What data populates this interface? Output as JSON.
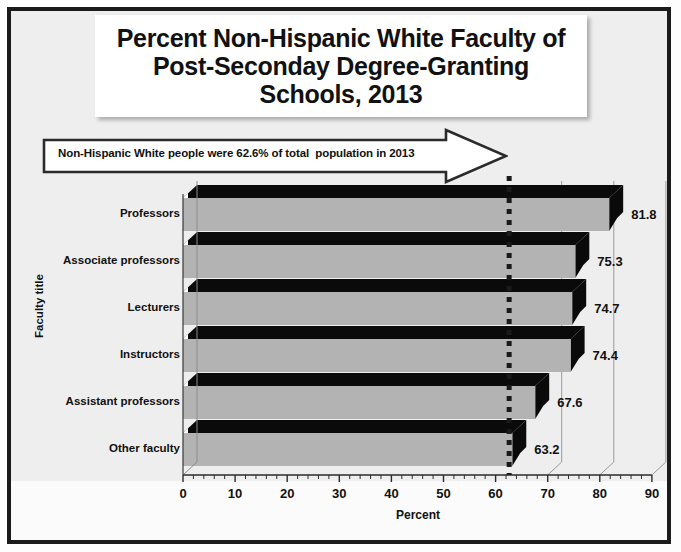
{
  "title": "Percent Non-Hispanic White Faculty of\nPost-Seconday Degree-Granting\nSchools, 2013",
  "callout": {
    "text": "Non-Hispanic White people were 62.6% of total  population in 2013",
    "reference_value": 62.6
  },
  "chart_data": {
    "type": "bar",
    "orientation": "horizontal",
    "title": "Percent Non-Hispanic White Faculty of Post-Seconday Degree-Granting Schools, 2013",
    "xlabel": "Percent",
    "ylabel": "Faculty title",
    "categories": [
      "Professors",
      "Associate professors",
      "Lecturers",
      "Instructors",
      "Assistant professors",
      "Other faculty"
    ],
    "values": [
      81.8,
      75.3,
      74.7,
      74.4,
      67.6,
      63.2
    ],
    "value_labels": [
      "81.8",
      "75.3",
      "74.7",
      "74.4",
      "67.6",
      "63.2"
    ],
    "xlim": [
      0,
      90
    ],
    "xticks": [
      0,
      10,
      20,
      30,
      40,
      50,
      60,
      70,
      80,
      90
    ],
    "xtick_labels": [
      "0",
      "10",
      "20",
      "30",
      "40",
      "50",
      "60",
      "70",
      "80",
      "90"
    ],
    "minor_tick_step": 2,
    "grid": "vertical-major-right-of-bars",
    "legend": "none",
    "bar_color": "#b3b3b3",
    "bar_shadow_color": "#0a0a0a",
    "reference_line": {
      "value": 62.6,
      "style": "dotted",
      "color": "#1a1a1a"
    }
  },
  "colors": {
    "frame": "#1b1b1b",
    "background": "#eeeeee",
    "bar_face": "#b3b3b3",
    "bar_dark": "#0a0a0a",
    "text": "#111111",
    "gridline": "#9a9a9a"
  }
}
